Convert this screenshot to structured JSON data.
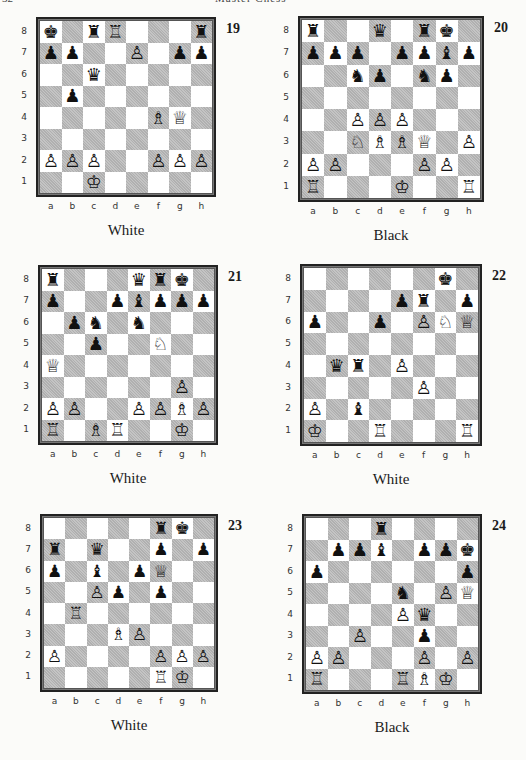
{
  "page": {
    "number": "32",
    "running_title": "Master Chess"
  },
  "file_labels": [
    "a",
    "b",
    "c",
    "d",
    "e",
    "f",
    "g",
    "h"
  ],
  "rank_labels": [
    "8",
    "7",
    "6",
    "5",
    "4",
    "3",
    "2",
    "1"
  ],
  "piece_glyphs": {
    "wK": "♔",
    "wQ": "♕",
    "wR": "♖",
    "wB": "♗",
    "wN": "♘",
    "wP": "♙",
    "bK": "♚",
    "bQ": "♛",
    "bR": "♜",
    "bB": "♝",
    "bN": "♞",
    "bP": "♟"
  },
  "diagrams": [
    {
      "number": "19",
      "to_move": "White",
      "layout": {
        "x": 36,
        "y": 17,
        "size": 180
      },
      "pieces": {
        "a8": "bK",
        "c8": "bR",
        "d8": "wR",
        "h8": "bR",
        "a7": "bP",
        "b7": "bP",
        "e7": "wP",
        "g7": "bP",
        "h7": "bP",
        "c6": "bQ",
        "b5": "bP",
        "f4": "wB",
        "g4": "wQ",
        "a2": "wP",
        "b2": "wP",
        "c2": "wP",
        "f2": "wP",
        "g2": "wP",
        "h2": "wP",
        "c1": "wK"
      }
    },
    {
      "number": "20",
      "to_move": "Black",
      "layout": {
        "x": 298,
        "y": 16,
        "size": 186
      },
      "pieces": {
        "a8": "bR",
        "d8": "bQ",
        "f8": "bR",
        "g8": "bK",
        "a7": "bP",
        "b7": "bP",
        "c7": "bP",
        "e7": "bP",
        "f7": "bP",
        "g7": "bB",
        "h7": "bP",
        "c6": "bN",
        "d6": "bP",
        "f6": "bN",
        "g6": "bP",
        "c4": "wP",
        "d4": "wP",
        "e4": "wP",
        "c3": "wN",
        "d3": "wB",
        "e3": "wB",
        "f3": "wQ",
        "h3": "wP",
        "a2": "wP",
        "b2": "wP",
        "f2": "wP",
        "g2": "wP",
        "a1": "wR",
        "e1": "wK",
        "h1": "wR"
      }
    },
    {
      "number": "21",
      "to_move": "White",
      "layout": {
        "x": 38,
        "y": 265,
        "size": 180
      },
      "pieces": {
        "a8": "bR",
        "e8": "bQ",
        "f8": "bR",
        "g8": "bK",
        "a7": "bP",
        "d7": "bP",
        "e7": "bB",
        "f7": "bP",
        "g7": "bP",
        "h7": "bP",
        "b6": "bP",
        "c6": "bN",
        "e6": "bN",
        "c5": "bP",
        "f5": "wN",
        "a4": "wQ",
        "g3": "wP",
        "a2": "wP",
        "b2": "wP",
        "e2": "wP",
        "f2": "wP",
        "g2": "wB",
        "h2": "wP",
        "a1": "wR",
        "c1": "wB",
        "d1": "wR",
        "g1": "wK"
      }
    },
    {
      "number": "22",
      "to_move": "White",
      "layout": {
        "x": 300,
        "y": 264,
        "size": 182
      },
      "pieces": {
        "g8": "bK",
        "e7": "bP",
        "f7": "bR",
        "h7": "bP",
        "a6": "bP",
        "d6": "bP",
        "f6": "wP",
        "g6": "wN",
        "h6": "wQ",
        "b4": "bQ",
        "c4": "bR",
        "e4": "wP",
        "f3": "wP",
        "a2": "wP",
        "c2": "bB",
        "a1": "wK",
        "d1": "wR",
        "h1": "wR"
      }
    },
    {
      "number": "23",
      "to_move": "White",
      "layout": {
        "x": 40,
        "y": 514,
        "size": 178
      },
      "pieces": {
        "f8": "bR",
        "g8": "bK",
        "a7": "bR",
        "c7": "bQ",
        "f7": "bP",
        "h7": "bP",
        "a6": "bP",
        "c6": "bB",
        "e6": "bP",
        "f6": "wQ",
        "c5": "wP",
        "d5": "bP",
        "f5": "bP",
        "b4": "wR",
        "d3": "wB",
        "e3": "wP",
        "a2": "wP",
        "f2": "wP",
        "g2": "wP",
        "h2": "wP",
        "f1": "wR",
        "g1": "wK"
      }
    },
    {
      "number": "24",
      "to_move": "Black",
      "layout": {
        "x": 302,
        "y": 514,
        "size": 180
      },
      "pieces": {
        "d8": "bR",
        "b7": "bP",
        "c7": "bP",
        "d7": "bB",
        "f7": "bP",
        "g7": "bP",
        "h7": "bK",
        "a6": "bP",
        "h6": "bP",
        "e5": "bN",
        "g5": "wP",
        "h5": "wQ",
        "e4": "wP",
        "f4": "bQ",
        "c3": "wP",
        "f3": "bP",
        "a2": "wP",
        "b2": "wP",
        "f2": "wP",
        "h2": "wP",
        "a1": "wR",
        "e1": "wR",
        "f1": "wB",
        "g1": "wK"
      }
    }
  ]
}
